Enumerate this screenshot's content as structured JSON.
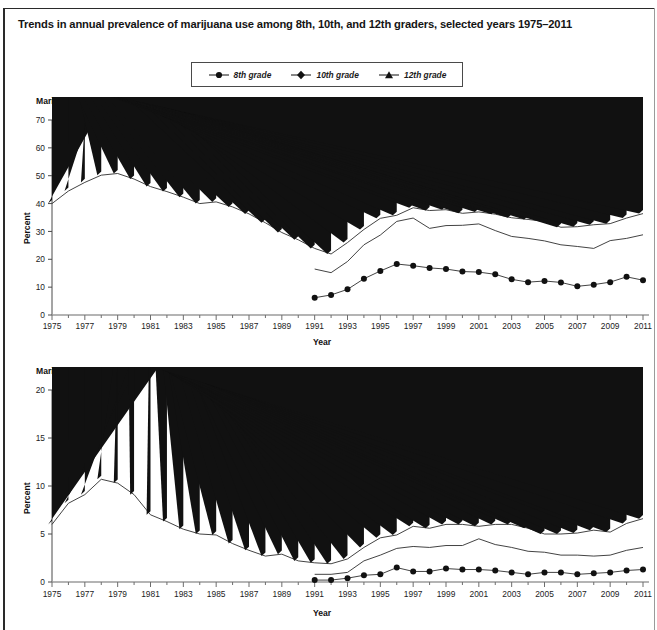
{
  "title": "Trends in annual prevalence of marijuana use among 8th, 10th, and 12th graders, selected years 1975–2011",
  "legend": {
    "position": "top-center",
    "entries": [
      {
        "label": "8th grade",
        "marker": "circle-marker-icon",
        "color": "#111111"
      },
      {
        "label": "10th grade",
        "marker": "diamond-marker-icon",
        "color": "#111111"
      },
      {
        "label": "12th grade",
        "marker": "triangle-marker-icon",
        "color": "#111111"
      }
    ]
  },
  "chart_data": [
    {
      "id": "annual",
      "type": "line",
      "title": "Marijuana (annual)",
      "xlabel": "Year",
      "ylabel": "Percent",
      "ylim": [
        0,
        70
      ],
      "yticks": [
        0,
        10,
        20,
        30,
        40,
        50,
        60,
        70
      ],
      "xlim": [
        1975,
        2011
      ],
      "xticks": [
        1975,
        1977,
        1979,
        1981,
        1983,
        1985,
        1987,
        1989,
        1991,
        1993,
        1995,
        1997,
        1999,
        2001,
        2003,
        2005,
        2007,
        2009,
        2011
      ],
      "grid": false,
      "x": [
        1975,
        1976,
        1977,
        1978,
        1979,
        1980,
        1981,
        1982,
        1983,
        1984,
        1985,
        1986,
        1987,
        1988,
        1989,
        1990,
        1991,
        1992,
        1993,
        1994,
        1995,
        1996,
        1997,
        1998,
        1999,
        2000,
        2001,
        2002,
        2003,
        2004,
        2005,
        2006,
        2007,
        2008,
        2009,
        2010,
        2011
      ],
      "series": [
        {
          "name": "8th grade",
          "marker": "circle",
          "values": [
            null,
            null,
            null,
            null,
            null,
            null,
            null,
            null,
            null,
            null,
            null,
            null,
            null,
            null,
            null,
            null,
            6.2,
            7.2,
            9.2,
            13.0,
            15.8,
            18.3,
            17.7,
            16.9,
            16.5,
            15.6,
            15.4,
            14.6,
            12.8,
            11.8,
            12.2,
            11.7,
            10.3,
            10.9,
            11.8,
            13.7,
            12.5
          ]
        },
        {
          "name": "10th grade",
          "marker": "diamond",
          "values": [
            null,
            null,
            null,
            null,
            null,
            null,
            null,
            null,
            null,
            null,
            null,
            null,
            null,
            null,
            null,
            null,
            16.5,
            15.2,
            19.2,
            25.2,
            28.7,
            33.6,
            34.8,
            31.1,
            32.1,
            32.2,
            32.7,
            30.3,
            28.2,
            27.5,
            26.6,
            25.2,
            24.6,
            23.9,
            26.7,
            27.5,
            28.8
          ]
        },
        {
          "name": "12th grade",
          "marker": "triangle",
          "values": [
            40.0,
            44.5,
            47.6,
            50.2,
            50.8,
            48.8,
            46.1,
            44.3,
            42.3,
            40.0,
            40.6,
            38.8,
            36.3,
            33.1,
            29.6,
            27.0,
            23.9,
            21.9,
            26.0,
            30.7,
            34.7,
            35.8,
            38.5,
            37.5,
            37.8,
            36.5,
            37.0,
            36.2,
            34.9,
            34.3,
            33.6,
            31.5,
            31.7,
            32.4,
            32.8,
            34.8,
            36.4
          ]
        }
      ]
    },
    {
      "id": "daily",
      "type": "line",
      "title": "Marijuana (daily)",
      "xlabel": "Year",
      "ylabel": "Percent",
      "ylim": [
        0,
        20
      ],
      "yticks": [
        0,
        5,
        10,
        15,
        20
      ],
      "xlim": [
        1975,
        2011
      ],
      "xticks": [
        1975,
        1977,
        1979,
        1981,
        1983,
        1985,
        1987,
        1989,
        1991,
        1993,
        1995,
        1997,
        1999,
        2001,
        2003,
        2005,
        2007,
        2009,
        2011
      ],
      "grid": false,
      "x": [
        1975,
        1976,
        1977,
        1978,
        1979,
        1980,
        1981,
        1982,
        1983,
        1984,
        1985,
        1986,
        1987,
        1988,
        1989,
        1990,
        1991,
        1992,
        1993,
        1994,
        1995,
        1996,
        1997,
        1998,
        1999,
        2000,
        2001,
        2002,
        2003,
        2004,
        2005,
        2006,
        2007,
        2008,
        2009,
        2010,
        2011
      ],
      "series": [
        {
          "name": "8th grade",
          "marker": "circle",
          "values": [
            null,
            null,
            null,
            null,
            null,
            null,
            null,
            null,
            null,
            null,
            null,
            null,
            null,
            null,
            null,
            null,
            0.2,
            0.2,
            0.4,
            0.7,
            0.8,
            1.5,
            1.1,
            1.1,
            1.4,
            1.3,
            1.3,
            1.2,
            1.0,
            0.8,
            1.0,
            1.0,
            0.8,
            0.9,
            1.0,
            1.2,
            1.3
          ]
        },
        {
          "name": "10th grade",
          "marker": "diamond",
          "values": [
            null,
            null,
            null,
            null,
            null,
            null,
            null,
            null,
            null,
            null,
            null,
            null,
            null,
            null,
            null,
            null,
            0.8,
            0.8,
            1.0,
            2.2,
            2.8,
            3.5,
            3.7,
            3.6,
            3.8,
            3.8,
            4.5,
            3.9,
            3.6,
            3.2,
            3.1,
            2.8,
            2.8,
            2.7,
            2.8,
            3.3,
            3.6
          ]
        },
        {
          "name": "12th grade",
          "marker": "triangle",
          "values": [
            6.0,
            8.2,
            9.1,
            10.7,
            10.3,
            9.1,
            7.0,
            6.3,
            5.5,
            5.0,
            4.9,
            4.0,
            3.3,
            2.7,
            2.9,
            2.2,
            2.0,
            1.9,
            2.4,
            3.6,
            4.6,
            4.9,
            5.8,
            5.6,
            6.0,
            6.0,
            5.8,
            6.0,
            6.0,
            5.6,
            5.0,
            5.0,
            5.1,
            5.4,
            5.2,
            6.1,
            6.6
          ]
        }
      ]
    }
  ]
}
